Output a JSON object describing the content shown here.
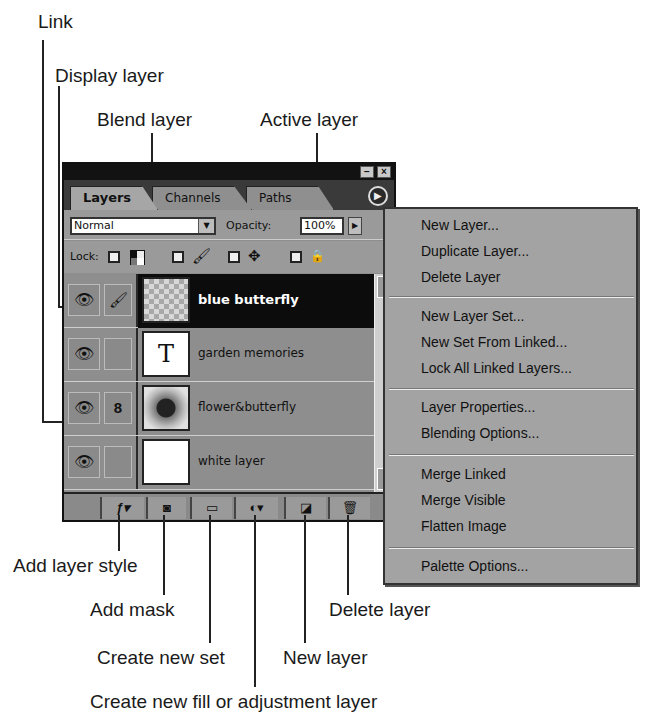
{
  "callouts": {
    "link": "Link",
    "display_layer": "Display layer",
    "blend_layer": "Blend layer",
    "active_layer": "Active layer",
    "add_layer_style": "Add layer style",
    "add_mask": "Add mask",
    "create_new_set": "Create new set",
    "create_fill_adjustment": "Create new fill or adjustment layer",
    "new_layer": "New layer",
    "delete_layer": "Delete layer"
  },
  "palette": {
    "titlebar": {
      "minimize": "−",
      "close": "×"
    },
    "tabs": [
      {
        "label": "Layers",
        "active": true
      },
      {
        "label": "Channels",
        "active": false
      },
      {
        "label": "Paths",
        "active": false
      }
    ],
    "menu_arrow": "▶",
    "blend_mode": "Normal",
    "opacity_label": "Opacity:",
    "opacity_value": "100%",
    "lock_label": "Lock:",
    "lock_icons": [
      "transparency-lock-icon",
      "brush-lock-icon",
      "move-lock-icon",
      "padlock-icon"
    ],
    "layers": [
      {
        "name": "blue butterfly",
        "active": true,
        "visible": true,
        "cell2": "brush",
        "thumb": "checker"
      },
      {
        "name": "garden memories",
        "active": false,
        "visible": true,
        "cell2": "",
        "thumb": "text",
        "thumb_text": "T"
      },
      {
        "name": "flower&butterfly",
        "active": false,
        "visible": true,
        "cell2": "link",
        "thumb": "flower"
      },
      {
        "name": "white layer",
        "active": false,
        "visible": true,
        "cell2": "",
        "thumb": "white"
      }
    ],
    "glyphs": {
      "eye": "👁",
      "brush": "🖌",
      "link": "8",
      "move": "✥",
      "lock": "🔒"
    },
    "bottom_buttons": [
      {
        "name": "add-layer-style",
        "glyph": "ƒ▾"
      },
      {
        "name": "add-mask",
        "glyph": "◙"
      },
      {
        "name": "create-new-set",
        "glyph": "▭"
      },
      {
        "name": "create-fill-adjustment",
        "glyph": "◐▾"
      },
      {
        "name": "new-layer",
        "glyph": "◪"
      },
      {
        "name": "delete-layer",
        "glyph": "🗑"
      }
    ]
  },
  "context_menu": {
    "groups": [
      [
        "New Layer...",
        "Duplicate Layer...",
        "Delete Layer"
      ],
      [
        "New Layer Set...",
        "New Set From Linked...",
        "Lock All Linked Layers..."
      ],
      [
        "Layer Properties...",
        "Blending Options..."
      ],
      [
        "Merge Linked",
        "Merge Visible",
        "Flatten Image"
      ],
      [
        "Palette Options..."
      ]
    ]
  }
}
